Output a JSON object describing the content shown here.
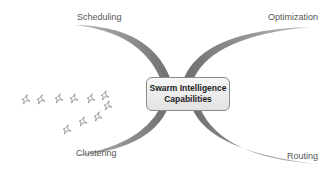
{
  "diagram": {
    "center": {
      "line1": "Swarm Intelligence",
      "line2": "Capabilities"
    },
    "branches": {
      "top_left": "Scheduling",
      "top_right": "Optimization",
      "bottom_left": "Clustering",
      "bottom_right": "Routing"
    },
    "decoration": {
      "icon": "star-swarm",
      "count": 10
    },
    "colors": {
      "arc": "#7a7a7a",
      "box_border": "#8a8a8a",
      "text": "#555555"
    }
  }
}
